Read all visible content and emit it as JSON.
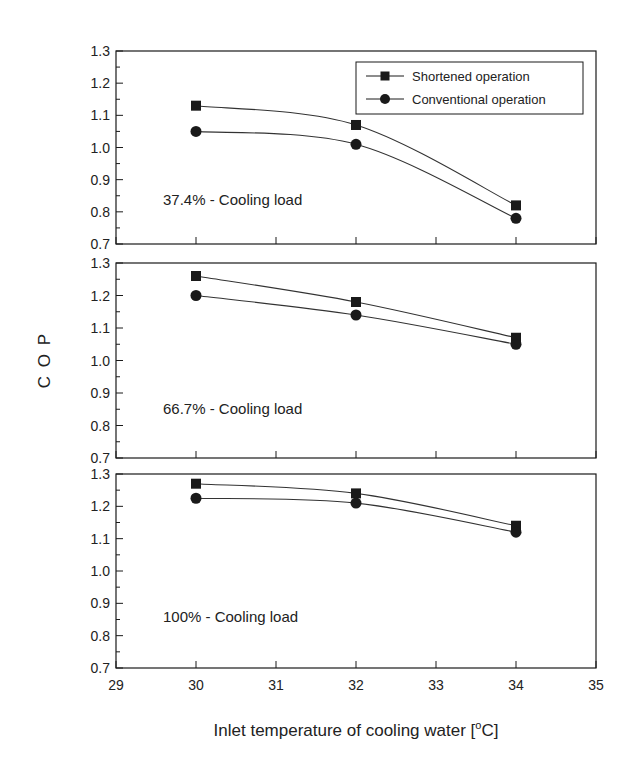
{
  "chart_data": {
    "type": "line",
    "title": "",
    "xlabel": "Inlet temperature of cooling water [°C]",
    "xlabel_parts": {
      "main": "Inlet temperature of cooling water [",
      "sup": "o",
      "unit": "C]"
    },
    "ylabel": "C O P",
    "x": [
      30,
      32,
      34
    ],
    "xlim": [
      29,
      35
    ],
    "xticks": [
      "29",
      "30",
      "31",
      "32",
      "33",
      "34",
      "35"
    ],
    "ylim": [
      0.7,
      1.3
    ],
    "yticks": [
      "0.7",
      "0.8",
      "0.9",
      "1.0",
      "1.1",
      "1.2",
      "1.3"
    ],
    "grid": false,
    "legend_position": "upper right (top panel)",
    "legend": [
      {
        "name": "Shortened operation",
        "marker": "square"
      },
      {
        "name": "Conventional operation",
        "marker": "circle"
      }
    ],
    "panels": [
      {
        "label": "37.4% - Cooling load",
        "series": [
          {
            "name": "Shortened operation",
            "marker": "square",
            "values": [
              1.13,
              1.07,
              0.82
            ]
          },
          {
            "name": "Conventional operation",
            "marker": "circle",
            "values": [
              1.05,
              1.01,
              0.78
            ]
          }
        ]
      },
      {
        "label": "66.7% - Cooling load",
        "series": [
          {
            "name": "Shortened operation",
            "marker": "square",
            "values": [
              1.26,
              1.18,
              1.07
            ]
          },
          {
            "name": "Conventional operation",
            "marker": "circle",
            "values": [
              1.2,
              1.14,
              1.05
            ]
          }
        ]
      },
      {
        "label": "100% - Cooling load",
        "series": [
          {
            "name": "Shortened operation",
            "marker": "square",
            "values": [
              1.27,
              1.24,
              1.14
            ]
          },
          {
            "name": "Conventional operation",
            "marker": "circle",
            "values": [
              1.225,
              1.21,
              1.12
            ]
          }
        ]
      }
    ]
  },
  "colors": {
    "ink": "#1a1a1a",
    "background": "#ffffff"
  }
}
